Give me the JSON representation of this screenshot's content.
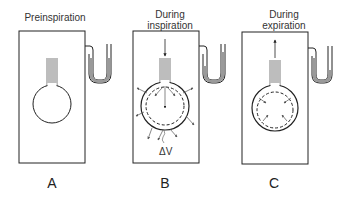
{
  "figure": {
    "panels": [
      {
        "id": "A",
        "label": "A",
        "title_lines": [
          "Preinspiration"
        ],
        "state": "preinspiration"
      },
      {
        "id": "B",
        "label": "B",
        "title_lines": [
          "During",
          "inspiration"
        ],
        "state": "inspiration",
        "annotation": "ΔV"
      },
      {
        "id": "C",
        "label": "C",
        "title_lines": [
          "During",
          "expiration"
        ],
        "state": "expiration"
      }
    ],
    "colors": {
      "line": "#222222",
      "fluid": "#9a9a9a",
      "arrow": "#555555"
    }
  }
}
